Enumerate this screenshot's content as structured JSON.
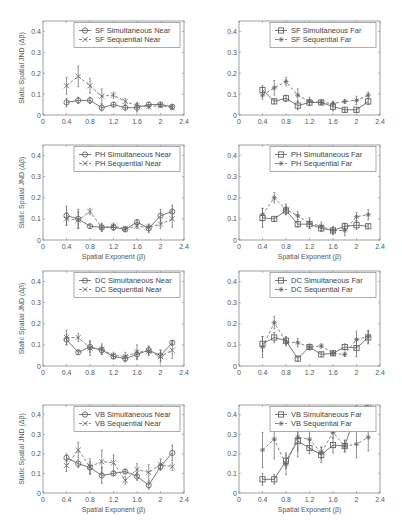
{
  "figure": {
    "ylabel": "Static Spatial JND (Δβ)",
    "xlabel": "Spatial Exponent (β)",
    "xticks": [
      "0",
      "0.4",
      "0.8",
      "1.2",
      "1.6",
      "2",
      "2.4"
    ],
    "yticks": [
      "0",
      "0.1",
      "0.2",
      "0.3",
      "0.4"
    ],
    "colors": {
      "axis": "#888888",
      "sim": "#555555",
      "seq": "#666666",
      "text": "#555555"
    }
  },
  "chart_data": [
    {
      "type": "line",
      "panel": "SF-Near",
      "title": "",
      "xlabel": "",
      "ylabel": "Static Spatial JND (Δβ)",
      "xlim": [
        0,
        2.4
      ],
      "ylim": [
        0,
        0.45
      ],
      "legend_position": "upper right",
      "x": [
        0.4,
        0.6,
        0.8,
        1.0,
        1.2,
        1.4,
        1.6,
        1.8,
        2.0,
        2.2
      ],
      "series": [
        {
          "name": "SF Simultaneous Near",
          "marker": "circle",
          "line": "solid",
          "values": [
            0.06,
            0.07,
            0.07,
            0.035,
            0.05,
            0.035,
            0.035,
            0.05,
            0.05,
            0.04
          ],
          "errors": [
            0.02,
            0.015,
            0.015,
            0.015,
            0.01,
            0.01,
            0.02,
            0.01,
            0.01,
            0.01
          ]
        },
        {
          "name": "SF Sequential Near",
          "marker": "x",
          "line": "dashed",
          "values": [
            0.14,
            0.185,
            0.14,
            0.09,
            0.095,
            0.065,
            0.045,
            0.04,
            0.045,
            0.035
          ],
          "errors": [
            0.04,
            0.05,
            0.035,
            0.035,
            0.015,
            0.015,
            0.015,
            0.01,
            0.01,
            0.01
          ]
        }
      ]
    },
    {
      "type": "line",
      "panel": "SF-Far",
      "title": "",
      "xlabel": "",
      "ylabel": "",
      "xlim": [
        0,
        2.4
      ],
      "ylim": [
        0,
        0.45
      ],
      "legend_position": "upper right",
      "x": [
        0.4,
        0.6,
        0.8,
        1.0,
        1.2,
        1.4,
        1.6,
        1.8,
        2.0,
        2.2
      ],
      "series": [
        {
          "name": "SF Simultaneous Far",
          "marker": "square",
          "line": "solid",
          "values": [
            0.12,
            0.065,
            0.08,
            0.045,
            0.06,
            0.06,
            0.04,
            0.025,
            0.025,
            0.065
          ],
          "errors": [
            0.02,
            0.01,
            0.015,
            0.02,
            0.015,
            0.01,
            0.02,
            0.01,
            0.01,
            0.015
          ]
        },
        {
          "name": "SF Sequential Far",
          "marker": "star",
          "line": "dashed",
          "values": [
            0.095,
            0.13,
            0.16,
            0.095,
            0.065,
            0.06,
            0.055,
            0.065,
            0.07,
            0.095
          ],
          "errors": [
            0.02,
            0.035,
            0.02,
            0.03,
            0.02,
            0.01,
            0.01,
            0.01,
            0.02,
            0.015
          ]
        }
      ]
    },
    {
      "type": "line",
      "panel": "PH-Near",
      "title": "",
      "xlabel": "Spatial Exponent (β)",
      "ylabel": "Static Spatial JND (Δβ)",
      "xlim": [
        0,
        2.4
      ],
      "ylim": [
        0,
        0.45
      ],
      "legend_position": "upper right",
      "x": [
        0.4,
        0.6,
        0.8,
        1.0,
        1.2,
        1.4,
        1.6,
        1.8,
        2.0,
        2.2
      ],
      "series": [
        {
          "name": "PH Simultaneous Near",
          "marker": "circle",
          "line": "solid",
          "values": [
            0.115,
            0.1,
            0.065,
            0.06,
            0.06,
            0.05,
            0.085,
            0.055,
            0.115,
            0.135
          ],
          "errors": [
            0.045,
            0.045,
            0.01,
            0.02,
            0.015,
            0.01,
            0.01,
            0.02,
            0.03,
            0.03
          ]
        },
        {
          "name": "PH Sequential Near",
          "marker": "x",
          "line": "dashed",
          "values": [
            0.1,
            0.095,
            0.135,
            0.06,
            0.065,
            0.055,
            0.065,
            0.06,
            0.075,
            0.1
          ],
          "errors": [
            0.03,
            0.04,
            0.015,
            0.015,
            0.015,
            0.01,
            0.01,
            0.015,
            0.02,
            0.04
          ]
        }
      ]
    },
    {
      "type": "line",
      "panel": "PH-Far",
      "title": "",
      "xlabel": "Spatial Exponent (β)",
      "ylabel": "",
      "xlim": [
        0,
        2.4
      ],
      "ylim": [
        0,
        0.45
      ],
      "legend_position": "upper right",
      "x": [
        0.4,
        0.6,
        0.8,
        1.0,
        1.2,
        1.4,
        1.6,
        1.8,
        2.0,
        2.2
      ],
      "series": [
        {
          "name": "PH Simultaneous Far",
          "marker": "square",
          "line": "solid",
          "values": [
            0.105,
            0.1,
            0.14,
            0.075,
            0.075,
            0.055,
            0.045,
            0.065,
            0.07,
            0.065
          ],
          "errors": [
            0.045,
            0.01,
            0.02,
            0.015,
            0.02,
            0.015,
            0.015,
            0.015,
            0.02,
            0.01
          ]
        },
        {
          "name": "PH Sequential Far",
          "marker": "star",
          "line": "dashed",
          "values": [
            0.12,
            0.2,
            0.145,
            0.115,
            0.08,
            0.065,
            0.045,
            0.045,
            0.11,
            0.12
          ],
          "errors": [
            0.03,
            0.025,
            0.025,
            0.02,
            0.025,
            0.02,
            0.02,
            0.025,
            0.02,
            0.025
          ]
        }
      ]
    },
    {
      "type": "line",
      "panel": "DC-Near",
      "title": "",
      "xlabel": "",
      "ylabel": "Static Spatial JND (Δβ)",
      "xlim": [
        0,
        2.4
      ],
      "ylim": [
        0,
        0.45
      ],
      "legend_position": "upper right",
      "x": [
        0.4,
        0.6,
        0.8,
        1.0,
        1.2,
        1.4,
        1.6,
        1.8,
        2.0,
        2.2
      ],
      "series": [
        {
          "name": "DC Simultaneous Near",
          "marker": "circle",
          "line": "solid",
          "values": [
            0.125,
            0.065,
            0.09,
            0.075,
            0.045,
            0.035,
            0.055,
            0.075,
            0.05,
            0.11
          ],
          "errors": [
            0.025,
            0.01,
            0.025,
            0.02,
            0.01,
            0.015,
            0.02,
            0.02,
            0.025,
            0.01
          ]
        },
        {
          "name": "DC Sequential Near",
          "marker": "x",
          "line": "dashed",
          "values": [
            0.135,
            0.135,
            0.085,
            0.08,
            0.05,
            0.045,
            0.065,
            0.07,
            0.045,
            0.075
          ],
          "errors": [
            0.035,
            0.02,
            0.035,
            0.025,
            0.015,
            0.02,
            0.035,
            0.02,
            0.03,
            0.04
          ]
        }
      ]
    },
    {
      "type": "line",
      "panel": "DC-Far",
      "title": "",
      "xlabel": "",
      "ylabel": "",
      "xlim": [
        0,
        2.4
      ],
      "ylim": [
        0,
        0.45
      ],
      "legend_position": "upper right",
      "x": [
        0.4,
        0.6,
        0.8,
        1.0,
        1.2,
        1.4,
        1.6,
        1.8,
        2.0,
        2.2
      ],
      "series": [
        {
          "name": "DC Simultaneous Far",
          "marker": "square",
          "line": "solid",
          "values": [
            0.105,
            0.135,
            0.12,
            0.035,
            0.09,
            0.055,
            0.06,
            0.09,
            0.085,
            0.135
          ],
          "errors": [
            0.035,
            0.025,
            0.02,
            0.01,
            0.01,
            0.01,
            0.01,
            0.015,
            0.04,
            0.03
          ]
        },
        {
          "name": "DC Sequential Far",
          "marker": "star",
          "line": "dashed",
          "values": [
            0.09,
            0.205,
            0.115,
            0.11,
            0.09,
            0.095,
            0.06,
            0.055,
            0.125,
            0.14
          ],
          "errors": [
            0.05,
            0.03,
            0.02,
            0.02,
            0.015,
            0.01,
            0.01,
            0.01,
            0.04,
            0.03
          ]
        }
      ]
    },
    {
      "type": "line",
      "panel": "VB-Near",
      "title": "",
      "xlabel": "Spatial Exponent (β)",
      "ylabel": "Static Spatial JND (Δβ)",
      "xlim": [
        0,
        2.4
      ],
      "ylim": [
        0,
        0.45
      ],
      "legend_position": "upper right",
      "x": [
        0.4,
        0.6,
        0.8,
        1.0,
        1.2,
        1.4,
        1.6,
        1.8,
        2.0,
        2.2
      ],
      "series": [
        {
          "name": "VB Simultaneous Near",
          "marker": "circle",
          "line": "solid",
          "values": [
            0.18,
            0.15,
            0.13,
            0.09,
            0.1,
            0.11,
            0.085,
            0.04,
            0.135,
            0.205
          ],
          "errors": [
            0.02,
            0.02,
            0.03,
            0.04,
            0.01,
            0.01,
            0.02,
            0.02,
            0.015,
            0.04
          ]
        },
        {
          "name": "VB Sequential Near",
          "marker": "x",
          "line": "dashed",
          "values": [
            0.14,
            0.22,
            0.135,
            0.16,
            0.155,
            0.065,
            0.12,
            0.105,
            0.145,
            0.135
          ],
          "errors": [
            0.03,
            0.04,
            0.04,
            0.06,
            0.04,
            0.02,
            0.03,
            0.04,
            0.03,
            0.02
          ]
        }
      ]
    },
    {
      "type": "line",
      "panel": "VB-Far",
      "title": "",
      "xlabel": "Spatial Exponent (β)",
      "ylabel": "",
      "xlim": [
        0,
        2.4
      ],
      "ylim": [
        0,
        0.45
      ],
      "legend_position": "upper right",
      "x": [
        0.4,
        0.6,
        0.8,
        1.0,
        1.2,
        1.4,
        1.6,
        1.8,
        2.0,
        2.2
      ],
      "series": [
        {
          "name": "VB Simultaneous Far",
          "marker": "square",
          "line": "solid",
          "values": [
            0.07,
            0.07,
            0.165,
            0.265,
            0.23,
            0.195,
            0.245,
            0.24,
            0.42,
            0.45
          ],
          "errors": [
            0.03,
            0.025,
            0.04,
            0.05,
            0.03,
            0.04,
            0.04,
            0.03,
            0.08,
            0.08
          ]
        },
        {
          "name": "VB Sequential Far",
          "marker": "star",
          "line": "dashed",
          "values": [
            0.22,
            0.275,
            0.145,
            0.285,
            0.275,
            0.205,
            0.31,
            0.24,
            0.25,
            0.285
          ],
          "errors": [
            0.09,
            0.1,
            0.05,
            0.1,
            0.05,
            0.03,
            0.03,
            0.03,
            0.07,
            0.07
          ]
        }
      ]
    }
  ],
  "layout": {
    "cols": [
      {
        "left": 43,
        "right": 184
      },
      {
        "left": 239,
        "right": 380
      }
    ],
    "rows": [
      {
        "top": 21,
        "bottom": 115
      },
      {
        "top": 145,
        "bottom": 240
      },
      {
        "top": 271,
        "bottom": 366
      },
      {
        "top": 405,
        "bottom": 493
      }
    ]
  }
}
